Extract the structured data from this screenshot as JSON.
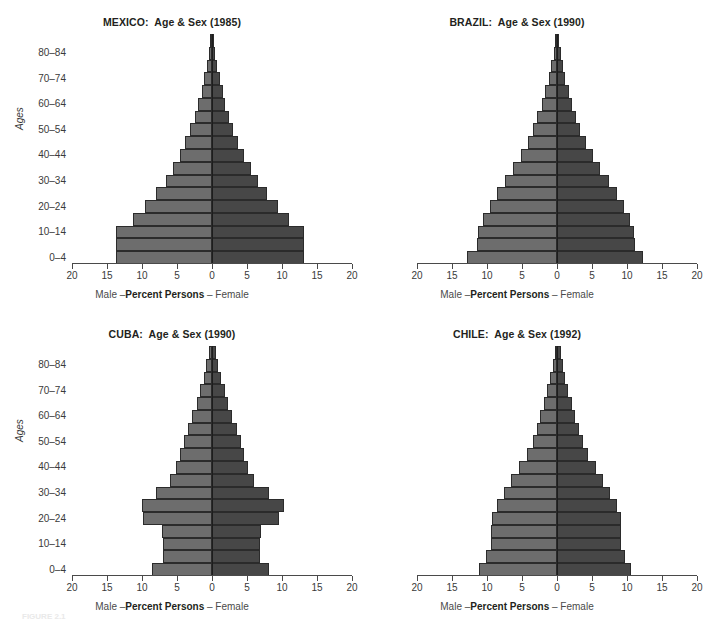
{
  "figure": {
    "caption": "FIGURE 2.1"
  },
  "axis": {
    "xlabel_male": "Male –",
    "xlabel_center": "Percent Persons",
    "xlabel_female": " – Female",
    "ylabel": "Ages",
    "xticks": [
      "20",
      "15",
      "10",
      "5",
      "0",
      "5",
      "10",
      "15",
      "20"
    ],
    "xtick_values": [
      -20,
      -15,
      -10,
      -5,
      0,
      5,
      10,
      15,
      20
    ],
    "xlim": [
      -20,
      20
    ],
    "ytick_labels": [
      "0–4",
      "10–14",
      "20–24",
      "30–34",
      "40–44",
      "50–54",
      "60–64",
      "70–74",
      "80–84"
    ],
    "age_groups": [
      "0–4",
      "5–9",
      "10–14",
      "15–19",
      "20–24",
      "25–29",
      "30–34",
      "35–39",
      "40–44",
      "45–49",
      "50–54",
      "55–59",
      "60–64",
      "65–69",
      "70–74",
      "75–79",
      "80–84",
      "85+"
    ],
    "male_color": "#6d6d6d",
    "female_color": "#474747",
    "grid": false,
    "legend": "none"
  },
  "chart_data": [
    {
      "type": "bar",
      "id": "mexico",
      "title": "MEXICO:  Age & Sex (1985)",
      "country": "MEXICO",
      "year": "1985",
      "xlabel": "Male –Percent Persons – Female",
      "ylabel": "Ages",
      "xlim": [
        -20,
        20
      ],
      "categories": [
        "0–4",
        "5–9",
        "10–14",
        "15–19",
        "20–24",
        "25–29",
        "30–34",
        "35–39",
        "40–44",
        "45–49",
        "50–54",
        "55–59",
        "60–64",
        "65–69",
        "70–74",
        "75–79",
        "80–84",
        "85+"
      ],
      "series": [
        {
          "name": "Male",
          "values": [
            13.7,
            13.7,
            13.7,
            11.3,
            9.6,
            8.0,
            6.6,
            5.6,
            4.6,
            3.8,
            3.1,
            2.5,
            2.0,
            1.5,
            1.1,
            0.7,
            0.45,
            0.25
          ]
        },
        {
          "name": "Female",
          "values": [
            13.2,
            13.2,
            13.2,
            11.0,
            9.4,
            7.9,
            6.5,
            5.5,
            4.5,
            3.7,
            3.0,
            2.4,
            1.9,
            1.5,
            1.1,
            0.7,
            0.45,
            0.25
          ]
        }
      ]
    },
    {
      "type": "bar",
      "id": "brazil",
      "title": "BRAZIL:  Age & Sex (1990)",
      "country": "BRAZIL",
      "year": "1990",
      "xlabel": "Male –Percent Persons – Female",
      "ylabel": "Ages",
      "xlim": [
        -20,
        20
      ],
      "categories": [
        "0–4",
        "5–9",
        "10–14",
        "15–19",
        "20–24",
        "25–29",
        "30–34",
        "35–39",
        "40–44",
        "45–49",
        "50–54",
        "55–59",
        "60–64",
        "65–69",
        "70–74",
        "75–79",
        "80–84",
        "85+"
      ],
      "series": [
        {
          "name": "Male",
          "values": [
            12.8,
            11.5,
            11.3,
            10.6,
            9.6,
            8.6,
            7.5,
            6.3,
            5.2,
            4.2,
            3.4,
            2.8,
            2.2,
            1.7,
            1.2,
            0.8,
            0.5,
            0.3
          ]
        },
        {
          "name": "Female",
          "values": [
            12.3,
            11.2,
            11.0,
            10.4,
            9.5,
            8.5,
            7.4,
            6.2,
            5.1,
            4.1,
            3.3,
            2.7,
            2.2,
            1.7,
            1.2,
            0.8,
            0.5,
            0.3
          ]
        }
      ]
    },
    {
      "type": "bar",
      "id": "cuba",
      "title": "CUBA:  Age & Sex (1990)",
      "country": "CUBA",
      "year": "1990",
      "xlabel": "Male –Percent Persons – Female",
      "ylabel": "Ages",
      "xlim": [
        -20,
        20
      ],
      "categories": [
        "0–4",
        "5–9",
        "10–14",
        "15–19",
        "20–24",
        "25–29",
        "30–34",
        "35–39",
        "40–44",
        "45–49",
        "50–54",
        "55–59",
        "60–64",
        "65–69",
        "70–74",
        "75–79",
        "80–84",
        "85+"
      ],
      "series": [
        {
          "name": "Male",
          "values": [
            8.6,
            7.0,
            7.0,
            7.1,
            9.8,
            10.0,
            8.0,
            6.0,
            5.2,
            4.6,
            4.0,
            3.4,
            2.8,
            2.2,
            1.7,
            1.2,
            0.8,
            0.45
          ]
        },
        {
          "name": "Female",
          "values": [
            8.2,
            6.8,
            6.8,
            7.0,
            9.5,
            10.3,
            8.1,
            6.0,
            5.2,
            4.6,
            4.1,
            3.5,
            2.9,
            2.3,
            1.8,
            1.3,
            0.9,
            0.5
          ]
        }
      ]
    },
    {
      "type": "bar",
      "id": "chile",
      "title": "CHILE:  Age & Sex (1992)",
      "country": "CHILE",
      "year": "1992",
      "xlabel": "Male –Percent Persons – Female",
      "ylabel": "Ages",
      "xlim": [
        -20,
        20
      ],
      "categories": [
        "0–4",
        "5–9",
        "10–14",
        "15–19",
        "20–24",
        "25–29",
        "30–34",
        "35–39",
        "40–44",
        "45–49",
        "50–54",
        "55–59",
        "60–64",
        "65–69",
        "70–74",
        "75–79",
        "80–84",
        "85+"
      ],
      "series": [
        {
          "name": "Male",
          "values": [
            11.2,
            10.1,
            9.5,
            9.5,
            9.3,
            8.6,
            7.6,
            6.6,
            5.4,
            4.3,
            3.5,
            2.9,
            2.4,
            1.9,
            1.4,
            1.0,
            0.6,
            0.35
          ]
        },
        {
          "name": "Female",
          "values": [
            10.6,
            9.7,
            9.2,
            9.2,
            9.1,
            8.5,
            7.6,
            6.6,
            5.5,
            4.4,
            3.7,
            3.1,
            2.6,
            2.1,
            1.6,
            1.2,
            0.8,
            0.5
          ]
        }
      ]
    }
  ]
}
